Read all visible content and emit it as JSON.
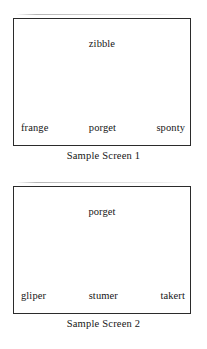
{
  "figure": {
    "screens": [
      {
        "caption": "Sample Screen 1",
        "title_label": "zibble",
        "options": [
          "frange",
          "porget",
          "sponty"
        ]
      },
      {
        "caption": "Sample Screen 2",
        "title_label": "porget",
        "options": [
          "gliper",
          "stumer",
          "takert"
        ]
      }
    ],
    "colors": {
      "ink": "#161616",
      "border": "#2b2b2b",
      "paper": "#ffffff"
    }
  }
}
